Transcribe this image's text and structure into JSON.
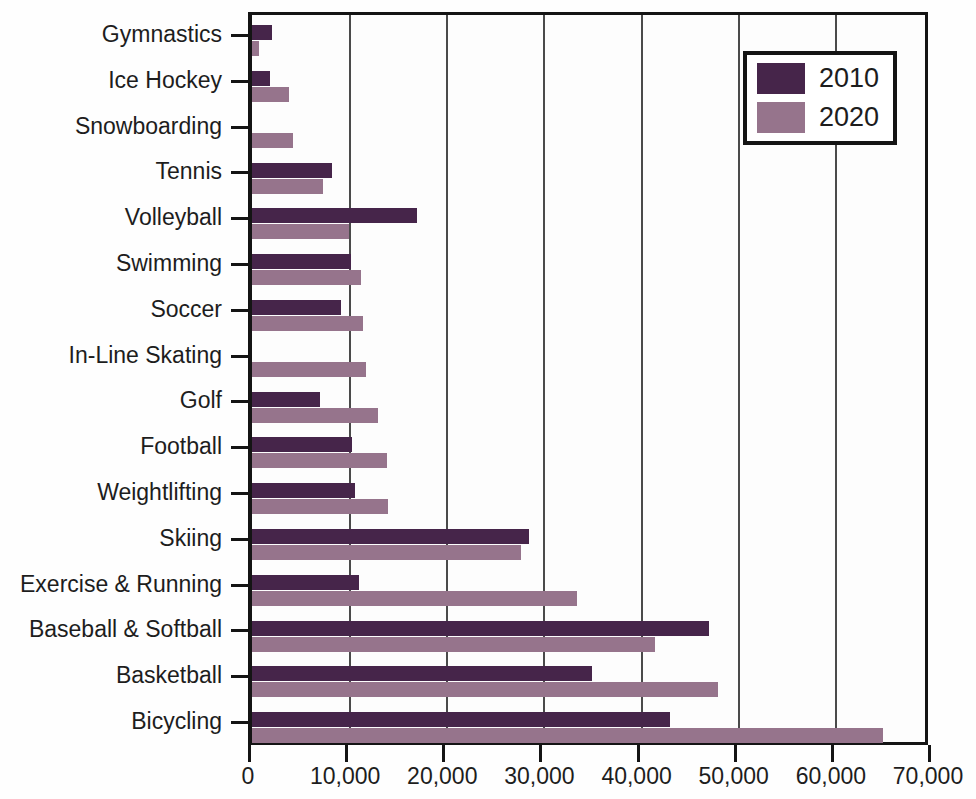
{
  "chart_data": {
    "type": "bar",
    "orientation": "horizontal",
    "title": "",
    "xlabel": "",
    "ylabel": "",
    "xlim": [
      0,
      70000
    ],
    "xticks": [
      0,
      10000,
      20000,
      30000,
      40000,
      50000,
      60000,
      70000
    ],
    "xticklabels": [
      "0",
      "10,000",
      "20,000",
      "30,000",
      "40,000",
      "50,000",
      "60,000",
      "70,000"
    ],
    "grid": true,
    "grid_axis": "x",
    "legend_position": "top-right",
    "categories": [
      "Gymnastics",
      "Ice Hockey",
      "Snowboarding",
      "Tennis",
      "Volleyball",
      "Swimming",
      "Soccer",
      "In-Line Skating",
      "Golf",
      "Football",
      "Weightlifting",
      "Skiing",
      "Exercise & Running",
      "Baseball & Softball",
      "Basketball",
      "Bicycling"
    ],
    "series": [
      {
        "name": "2010",
        "color": "#46254a",
        "values": [
          2100,
          1900,
          0,
          8200,
          17000,
          10200,
          9200,
          0,
          7000,
          10300,
          10600,
          28500,
          11000,
          47000,
          35000,
          43000
        ]
      },
      {
        "name": "2020",
        "color": "#96748c",
        "values": [
          700,
          3800,
          4200,
          7300,
          10000,
          11200,
          11400,
          11700,
          13000,
          13900,
          14000,
          27700,
          33500,
          41500,
          48000,
          65000
        ]
      }
    ]
  },
  "legend": {
    "entries": [
      {
        "label": "2010",
        "color": "#46254a"
      },
      {
        "label": "2020",
        "color": "#96748c"
      }
    ]
  },
  "axis": {
    "x_tick_labels": [
      "0",
      "10,000",
      "20,000",
      "30,000",
      "40,000",
      "50,000",
      "60,000",
      "70,000"
    ],
    "y_tick_labels": [
      "Gymnastics",
      "Ice Hockey",
      "Snowboarding",
      "Tennis",
      "Volleyball",
      "Swimming",
      "Soccer",
      "In-Line Skating",
      "Golf",
      "Football",
      "Weightlifting",
      "Skiing",
      "Exercise & Running",
      "Baseball & Softball",
      "Basketball",
      "Bicycling"
    ]
  }
}
